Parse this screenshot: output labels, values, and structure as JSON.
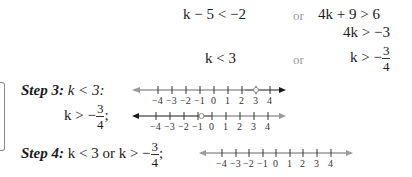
{
  "equations": {
    "row1_left": "k − 5 < −2",
    "row1_or": "or",
    "row1_right": "4k + 9 > 6",
    "row2_right": "4k > −3",
    "row3_left": "k < 3",
    "row3_or": "or",
    "row3_right_prefix": "k > −",
    "row3_right_num": "3",
    "row3_right_den": "4"
  },
  "step3": {
    "label": "Step 3:",
    "line1_text": "k < 3:",
    "line2_prefix": "k > −",
    "line2_num": "3",
    "line2_den": "4",
    "line2_suffix": ";"
  },
  "step4": {
    "label": "Step 4:",
    "text_prefix": "k < 3 or k > −",
    "num": "3",
    "den": "4",
    "suffix": ";"
  },
  "number_lines": {
    "tick_labels": [
      "−4",
      "−3",
      "−2",
      "−1",
      "0",
      "1",
      "2",
      "3",
      "4"
    ],
    "line1": {
      "shaded": "x < 3",
      "open_circle_at": 3
    },
    "line2": {
      "shaded": "x > -3/4",
      "open_circle_at": -0.75
    },
    "line3": {
      "shaded": "all real numbers"
    }
  },
  "colors": {
    "shaded": "#9a9a9a",
    "unshaded": "#1a1a1a"
  }
}
